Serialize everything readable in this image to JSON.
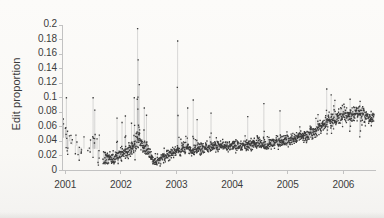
{
  "figure": {
    "background_color": "#faf9f7",
    "point_color": "#2f2f2f",
    "line_color": "#b9b9b9",
    "axis_color": "#bdbdbd",
    "text_color": "#3a3a3a"
  },
  "chart_data": {
    "type": "scatter",
    "title": "",
    "subtitle": "",
    "xlabel": "",
    "ylabel": "Edit proportion",
    "xlim": [
      2000.95,
      2006.55
    ],
    "ylim": [
      0,
      0.2
    ],
    "grid": false,
    "legend": null,
    "marker": "small filled square",
    "connector": "vertical drop lines to neighbouring daily values",
    "x_ticks": [
      2001,
      2002,
      2003,
      2004,
      2005,
      2006
    ],
    "x_tick_labels": [
      "2001",
      "2002",
      "2003",
      "2004",
      "2005",
      "2006"
    ],
    "y_ticks": [
      0,
      0.02,
      0.04,
      0.06,
      0.08,
      0.1,
      0.12,
      0.14,
      0.16,
      0.18,
      0.2
    ],
    "y_tick_labels": [
      "0",
      "0.02",
      "0.04",
      "0.06",
      "0.08",
      "0.1",
      "0.12",
      "0.14",
      "0.16",
      "0.18",
      "0.2"
    ],
    "annotations": [
      {
        "x": 2002.3,
        "y": 0.195,
        "note": "tallest spike"
      },
      {
        "x": 2003.02,
        "y": 0.178,
        "note": "second tallest spike"
      }
    ],
    "series": [
      {
        "name": "Edit proportion",
        "color": "#2f2f2f",
        "description": "Daily edit proportion of Wikipedia, noisy early period 2001, dense cloud from late 2001 onwards, trough mid-2002, steady upward trend through 2005-2006.",
        "trend_control_points": [
          {
            "x": 2001.0,
            "y": 0.045,
            "spread": 0.03
          },
          {
            "x": 2001.15,
            "y": 0.035,
            "spread": 0.028
          },
          {
            "x": 2001.35,
            "y": 0.03,
            "spread": 0.022
          },
          {
            "x": 2001.55,
            "y": 0.03,
            "spread": 0.03
          },
          {
            "x": 2001.72,
            "y": 0.015,
            "spread": 0.016
          },
          {
            "x": 2001.85,
            "y": 0.016,
            "spread": 0.012
          },
          {
            "x": 2002.0,
            "y": 0.022,
            "spread": 0.013
          },
          {
            "x": 2002.15,
            "y": 0.028,
            "spread": 0.014
          },
          {
            "x": 2002.3,
            "y": 0.042,
            "spread": 0.02
          },
          {
            "x": 2002.45,
            "y": 0.028,
            "spread": 0.013
          },
          {
            "x": 2002.62,
            "y": 0.011,
            "spread": 0.008
          },
          {
            "x": 2002.78,
            "y": 0.019,
            "spread": 0.01
          },
          {
            "x": 2002.95,
            "y": 0.026,
            "spread": 0.012
          },
          {
            "x": 2003.12,
            "y": 0.03,
            "spread": 0.014
          },
          {
            "x": 2003.3,
            "y": 0.028,
            "spread": 0.012
          },
          {
            "x": 2003.5,
            "y": 0.031,
            "spread": 0.011
          },
          {
            "x": 2003.7,
            "y": 0.033,
            "spread": 0.011
          },
          {
            "x": 2003.9,
            "y": 0.034,
            "spread": 0.01
          },
          {
            "x": 2004.1,
            "y": 0.034,
            "spread": 0.01
          },
          {
            "x": 2004.35,
            "y": 0.036,
            "spread": 0.01
          },
          {
            "x": 2004.6,
            "y": 0.036,
            "spread": 0.011
          },
          {
            "x": 2004.85,
            "y": 0.04,
            "spread": 0.011
          },
          {
            "x": 2005.05,
            "y": 0.042,
            "spread": 0.011
          },
          {
            "x": 2005.25,
            "y": 0.046,
            "spread": 0.012
          },
          {
            "x": 2005.45,
            "y": 0.052,
            "spread": 0.012
          },
          {
            "x": 2005.65,
            "y": 0.062,
            "spread": 0.014
          },
          {
            "x": 2005.85,
            "y": 0.072,
            "spread": 0.016
          },
          {
            "x": 2006.05,
            "y": 0.076,
            "spread": 0.014
          },
          {
            "x": 2006.25,
            "y": 0.08,
            "spread": 0.015
          },
          {
            "x": 2006.45,
            "y": 0.073,
            "spread": 0.012
          }
        ],
        "spikes": [
          {
            "x": 2001.02,
            "y": 0.1
          },
          {
            "x": 2001.04,
            "y": 0.054
          },
          {
            "x": 2001.5,
            "y": 0.1
          },
          {
            "x": 2001.53,
            "y": 0.083
          },
          {
            "x": 2001.93,
            "y": 0.072
          },
          {
            "x": 2002.02,
            "y": 0.066
          },
          {
            "x": 2002.08,
            "y": 0.075
          },
          {
            "x": 2002.19,
            "y": 0.065
          },
          {
            "x": 2002.24,
            "y": 0.1
          },
          {
            "x": 2002.3,
            "y": 0.195
          },
          {
            "x": 2002.31,
            "y": 0.152
          },
          {
            "x": 2002.33,
            "y": 0.118
          },
          {
            "x": 2002.42,
            "y": 0.086
          },
          {
            "x": 2002.46,
            "y": 0.076
          },
          {
            "x": 2003.02,
            "y": 0.178
          },
          {
            "x": 2003.2,
            "y": 0.086
          },
          {
            "x": 2003.3,
            "y": 0.097
          },
          {
            "x": 2003.37,
            "y": 0.07
          },
          {
            "x": 2003.62,
            "y": 0.079
          },
          {
            "x": 2004.28,
            "y": 0.074
          },
          {
            "x": 2004.57,
            "y": 0.092
          },
          {
            "x": 2004.86,
            "y": 0.082
          },
          {
            "x": 2005.7,
            "y": 0.112
          },
          {
            "x": 2005.78,
            "y": 0.104
          },
          {
            "x": 2006.12,
            "y": 0.098
          },
          {
            "x": 2006.3,
            "y": 0.095
          }
        ]
      }
    ]
  }
}
